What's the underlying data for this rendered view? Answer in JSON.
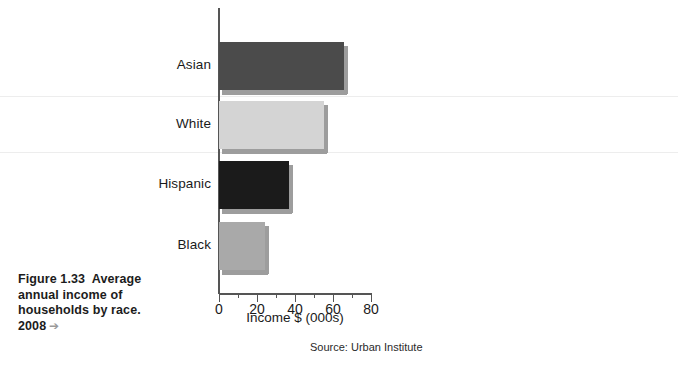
{
  "caption": {
    "line1": "Figure 1.33  Average",
    "line2": "annual income of",
    "line3": "households by race.",
    "line4": "2008",
    "arrow": "➔"
  },
  "source_note": "Source: Urban Institute",
  "chart_data": {
    "type": "bar",
    "orientation": "horizontal",
    "title": "",
    "categories": [
      "Asian",
      "White",
      "Hispanic",
      "Black"
    ],
    "values": [
      66,
      55,
      37,
      24
    ],
    "series": [
      {
        "name": "Average annual household income",
        "values": [
          66,
          55,
          37,
          24
        ]
      }
    ],
    "bar_colors": [
      "#4b4b4b",
      "#d4d4d4",
      "#1b1b1b",
      "#a9a9a9"
    ],
    "shadow_color": "#9d9d9d",
    "xlabel": "Income $ (000s)",
    "ylabel": "",
    "xlim": [
      0,
      80
    ],
    "xticks": [
      0,
      20,
      40,
      60,
      80
    ],
    "xtick_labels": [
      "0",
      "20",
      "40",
      "60",
      "80"
    ],
    "xticks_minor": [
      10,
      30,
      50,
      70
    ],
    "ytick_labels": [
      "Asian",
      "White",
      "Hispanic",
      "Black"
    ],
    "grid": false,
    "legend": "none",
    "axis_color": "#555555"
  }
}
